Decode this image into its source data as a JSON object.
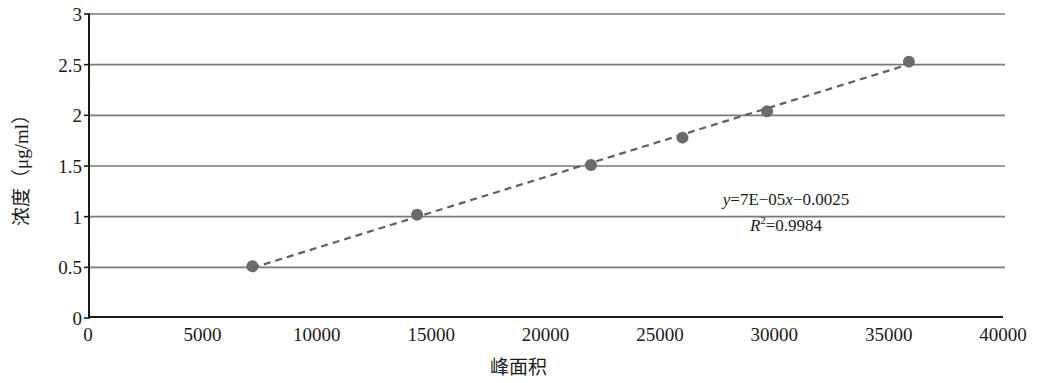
{
  "chart_data": {
    "type": "scatter",
    "title": "",
    "xlabel": "峰面积",
    "ylabel": "浓度（μg/ml）",
    "xlim": [
      0,
      40000
    ],
    "ylim": [
      0,
      3
    ],
    "grid": true,
    "legend": null,
    "x_ticks": [
      "0",
      "5000",
      "10000",
      "15000",
      "20000",
      "25000",
      "30000",
      "35000",
      "40000"
    ],
    "x_tick_values": [
      0,
      5000,
      10000,
      15000,
      20000,
      25000,
      30000,
      35000,
      40000
    ],
    "y_ticks": [
      "0",
      "0.5",
      "1",
      "1.5",
      "2",
      "2.5",
      "3"
    ],
    "y_tick_values": [
      0,
      0.5,
      1,
      1.5,
      2,
      2.5,
      3
    ],
    "series": [
      {
        "name": "标准曲线",
        "marker": "circle",
        "marker_color": "#6b6b6b",
        "line_style": "dashed",
        "line_color": "#5f5f5f",
        "x": [
          7100,
          14300,
          21900,
          25900,
          29600,
          35800
        ],
        "y": [
          0.51,
          1.02,
          1.51,
          1.78,
          2.04,
          2.53
        ]
      }
    ],
    "trendline": {
      "style": "dashed",
      "color": "#5f5f5f",
      "slope": 7e-05,
      "intercept": -0.0025
    },
    "annotations": {
      "equation_y": "y",
      "equation_body": "=7E−05",
      "equation_x": "x",
      "equation_tail": "−0.0025",
      "r_symbol": "R",
      "r_exponent": "2",
      "r_value": "=0.9984",
      "equation_full": "y=7E−05x−0.0025",
      "r_squared_full": "R2=0.9984"
    },
    "colors": {
      "axis": "#1a1a1a",
      "gridline": "#7a7a7a",
      "marker": "#6b6b6b",
      "trendline": "#5f5f5f",
      "background": "#ffffff"
    }
  }
}
